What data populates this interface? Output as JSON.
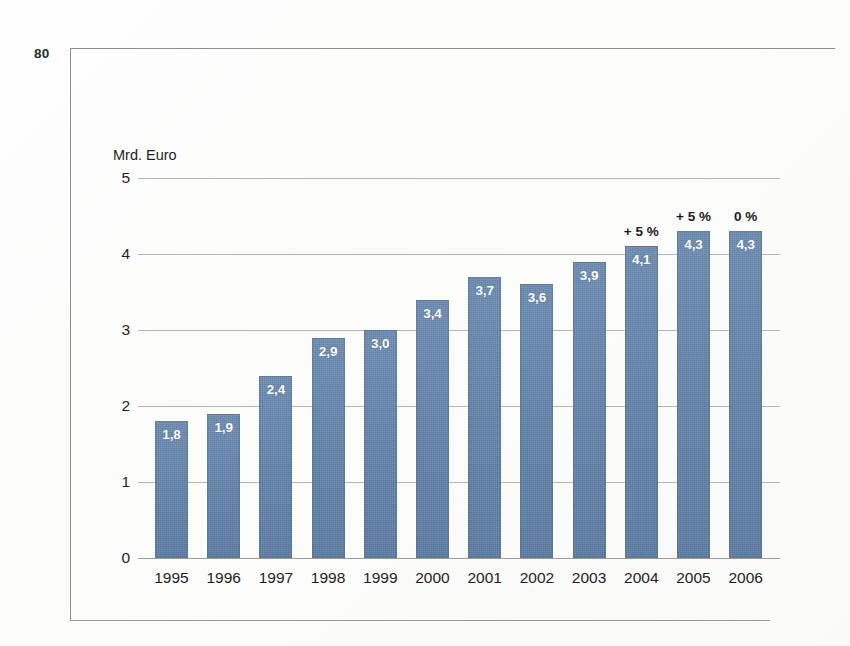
{
  "folio": "80",
  "chart_data": {
    "type": "bar",
    "title": "",
    "subtitle": "",
    "unit_label": "Mrd. Euro",
    "xlabel": "",
    "ylabel": "Mrd. Euro",
    "ylim": [
      0,
      5
    ],
    "yticks": [
      "0",
      "1",
      "2",
      "3",
      "4",
      "5"
    ],
    "ytick_values": [
      0,
      1,
      2,
      3,
      4,
      5
    ],
    "grid": true,
    "legend": "none",
    "categories": [
      "1995",
      "1996",
      "1997",
      "1998",
      "1999",
      "2000",
      "2001",
      "2002",
      "2003",
      "2004",
      "2005",
      "2006"
    ],
    "values": [
      1.8,
      1.9,
      2.4,
      2.9,
      3.0,
      3.4,
      3.7,
      3.6,
      3.9,
      4.1,
      4.3,
      4.3
    ],
    "value_labels": [
      "1,8",
      "1,9",
      "2,4",
      "2,9",
      "3,0",
      "3,4",
      "3,7",
      "3,6",
      "3,9",
      "4,1",
      "4,3",
      "4,3"
    ],
    "annotations": [
      "",
      "",
      "",
      "",
      "",
      "",
      "",
      "",
      "",
      "+ 5 %",
      "+ 5 %",
      "0 %"
    ],
    "colors": {
      "bar": "#5c7ca4",
      "grid": "#b4b4b4",
      "axis": "#9c9c9c",
      "frame": "#8d8d8d",
      "value_label": "#ffffff",
      "text": "#1f1f1f"
    }
  }
}
